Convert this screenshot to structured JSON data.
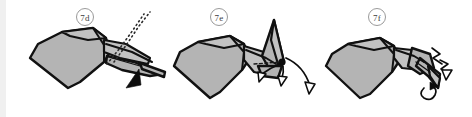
{
  "figure": {
    "background_color": "#ffffff",
    "paper_fill_color": "#b4b4b4",
    "paper_fill_light_color": "#c2c2c2",
    "outline_color": "#111111",
    "label_text_color": "#3b3b3b",
    "label_ring_color": "#9a9a9a",
    "panel_count": 3
  },
  "panels": [
    {
      "id": "7d",
      "label": "7d",
      "label_x": 85,
      "label_y": 17,
      "description": "Bird form with wide wing body at left and elongated narrow beak at right; dotted hidden-line indicator rises up-right from the beak, solid black arrowhead below points up-right into the beak",
      "markers": {
        "dotted_hidden_line": true,
        "solid_arrowhead": true,
        "hollow_arrows": 0,
        "pivot_dot": false,
        "zigzag": false
      }
    },
    {
      "id": "7e",
      "label": "7e",
      "label_x": 219,
      "label_y": 17,
      "description": "Same bird form rotated with the head raised into a tall narrow spike at right; a black pivot dot sits at the head base with two hollow outline arrows swinging downward and a long curved arrow sweeping down-right",
      "markers": {
        "dotted_hidden_line": false,
        "solid_arrowhead": false,
        "hollow_arrows": 2,
        "pivot_dot": true,
        "dashed_fold": true,
        "zigzag": false
      }
    },
    {
      "id": "7f",
      "label": "7f",
      "label_x": 377,
      "label_y": 17,
      "description": "Completed form with the beak folded down into a thin tapered point at right; small zigzag action lines and a tight curl arrow mark the finished crimped head",
      "markers": {
        "dotted_hidden_line": false,
        "solid_arrowhead": false,
        "hollow_arrows": 1,
        "pivot_dot": false,
        "dashed_fold": false,
        "zigzag": true
      }
    }
  ]
}
